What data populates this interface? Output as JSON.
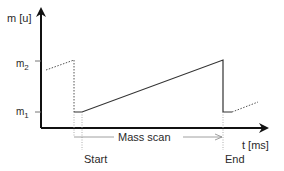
{
  "diagram": {
    "y_axis_label": "m [u]",
    "x_axis_label": "t [ms]",
    "tick_m2": "m",
    "tick_m2_sub": "2",
    "tick_m1": "m",
    "tick_m1_sub": "1",
    "scan_label": "Mass scan",
    "start_label": "Start",
    "end_label": "End",
    "colors": {
      "axis": "#111111",
      "line": "#333333",
      "dotted": "#555555",
      "guide": "#999999"
    }
  }
}
